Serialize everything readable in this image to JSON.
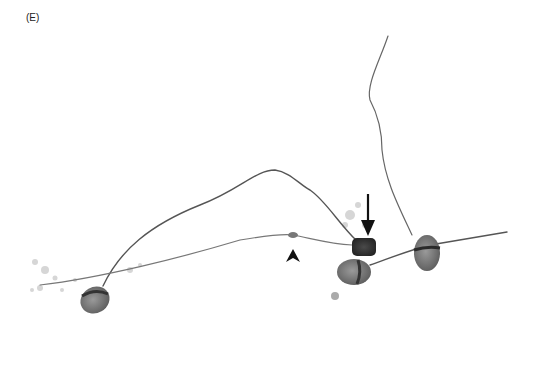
{
  "figure": {
    "panel_label": "(E)",
    "annotations": [
      {
        "type": "arrow",
        "name": "down-arrow",
        "x": 368,
        "y": 195
      },
      {
        "type": "arrowhead",
        "name": "arrowhead",
        "x": 293,
        "y": 258
      }
    ],
    "colors": {
      "background": "#ffffff",
      "cell_dark": "#3a3a3a",
      "cell_mid": "#7a7a7a",
      "flagellum": "#6a6a6a",
      "debris": "#cfcfcf"
    }
  }
}
